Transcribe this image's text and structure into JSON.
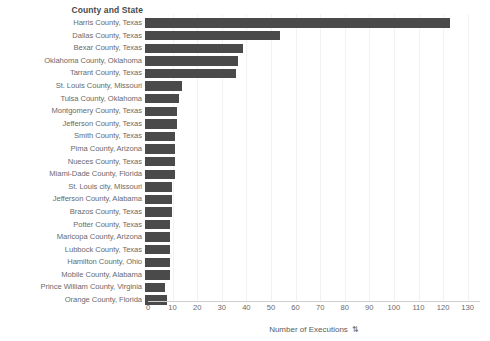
{
  "header": {
    "row_header": "County and State"
  },
  "axis": {
    "x_title": "Number of Executions",
    "x_title_sort_icon": "⇅",
    "ticks": [
      0,
      10,
      20,
      30,
      40,
      50,
      60,
      70,
      80,
      90,
      100,
      110,
      120,
      130
    ]
  },
  "colors": {
    "bar": "#4a4a4a",
    "label": "#6a6a6a",
    "grid": "#f2f2f2",
    "background": "#ffffff"
  },
  "chart_data": {
    "type": "bar",
    "orientation": "horizontal",
    "title": "",
    "xlabel": "Number of Executions",
    "ylabel": "County and State",
    "xlim": [
      0,
      135
    ],
    "grid": true,
    "legend": "none",
    "categories": [
      "Harris County, Texas",
      "Dallas County, Texas",
      "Bexar County, Texas",
      "Oklahoma County, Oklahoma",
      "Tarrant County, Texas",
      "St. Louis County, Missouri",
      "Tulsa County, Oklahoma",
      "Montgomery County, Texas",
      "Jefferson County, Texas",
      "Smith County, Texas",
      "Pima County, Arizona",
      "Nueces County, Texas",
      "Miami-Dade County, Florida",
      "St. Louis city, Missouri",
      "Jefferson County, Alabama",
      "Brazos County, Texas",
      "Potter County, Texas",
      "Maricopa County, Arizona",
      "Lubbock County, Texas",
      "Hamilton County, Ohio",
      "Mobile County, Alabama",
      "Prince William County, Virginia",
      "Orange County, Florida"
    ],
    "values": [
      124,
      55,
      40,
      38,
      37,
      15,
      14,
      13,
      13,
      12,
      12,
      12,
      12,
      11,
      11,
      11,
      10,
      10,
      10,
      10,
      10,
      8,
      9
    ]
  }
}
